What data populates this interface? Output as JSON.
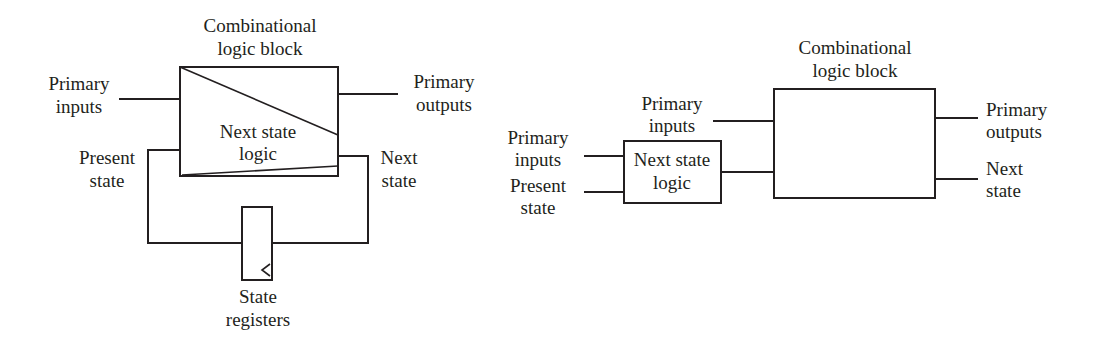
{
  "left_diagram": {
    "comb_block_label": [
      "Combinational",
      "logic block"
    ],
    "primary_inputs_label": [
      "Primary",
      "inputs"
    ],
    "primary_outputs_label": [
      "Primary",
      "outputs"
    ],
    "next_state_logic_label": [
      "Next state",
      "logic"
    ],
    "present_state_label": [
      "Present",
      "state"
    ],
    "next_state_label": [
      "Next",
      "state"
    ],
    "state_registers_label": [
      "State",
      "registers"
    ]
  },
  "right_diagram": {
    "comb_block_label": [
      "Combinational",
      "logic block"
    ],
    "primary_inputs_top_label": [
      "Primary",
      "inputs"
    ],
    "primary_inputs_left_label": [
      "Primary",
      "inputs"
    ],
    "present_state_label": [
      "Present",
      "state"
    ],
    "next_state_logic_label": [
      "Next state",
      "logic"
    ],
    "primary_outputs_label": [
      "Primary",
      "outputs"
    ],
    "next_state_label": [
      "Next",
      "state"
    ]
  },
  "colors": {
    "stroke": "#231f20",
    "background": "#ffffff"
  }
}
